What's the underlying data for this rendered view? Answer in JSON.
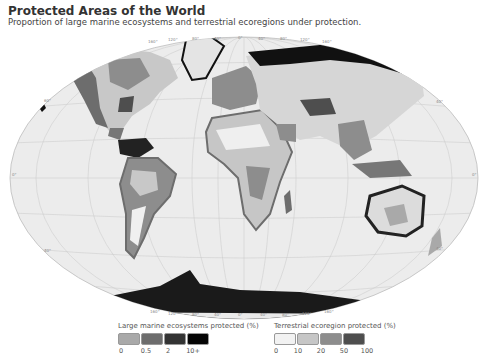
{
  "header": {
    "title": "Protected Areas of the World",
    "subtitle": "Proportion of large marine ecosystems and terrestrial ecoregions under protection."
  },
  "map": {
    "projection": "Winkel tripel (ellipse)",
    "ocean_color": "#ececec",
    "graticule_color": "#c4c4c4",
    "top_longitude_labels": [
      "160°",
      "120°",
      "80°",
      "40°",
      "0°",
      "40°",
      "80°",
      "120°",
      "160°"
    ],
    "bottom_longitude_labels": [
      "160°",
      "120°",
      "80°",
      "40°",
      "0°",
      "40°",
      "80°",
      "120°",
      "160°"
    ],
    "latitude_labels_left": [
      "60°",
      "0°",
      "40°"
    ],
    "latitude_labels_right": [
      "40°",
      "0°",
      "40°"
    ]
  },
  "legend_marine": {
    "title": "Large marine ecosystems protected (%)",
    "colors": [
      "#a9a9a9",
      "#6d6d6d",
      "#333333",
      "#050505"
    ],
    "ticks": [
      "0",
      "0.5",
      "2",
      "10+"
    ]
  },
  "legend_terrestrial": {
    "title": "Terrestrial ecoregion protected (%)",
    "colors": [
      "#f2f2f2",
      "#c6c6c6",
      "#8d8d8d",
      "#4e4e4e"
    ],
    "ticks": [
      "0",
      "10",
      "20",
      "50",
      "100"
    ]
  }
}
